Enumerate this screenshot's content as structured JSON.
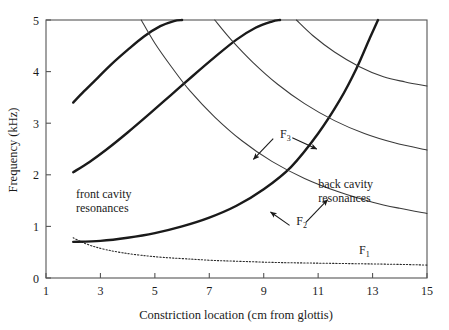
{
  "chart_data": {
    "type": "line",
    "title": "",
    "xlabel": "Constriction location (cm from glottis)",
    "ylabel": "Frequency (kHz)",
    "xlim": [
      1,
      15
    ],
    "ylim": [
      0,
      5
    ],
    "xticks": [
      "1",
      "3",
      "5",
      "7",
      "9",
      "11",
      "13",
      "15"
    ],
    "xtick_values": [
      1,
      3,
      5,
      7,
      9,
      11,
      13,
      15
    ],
    "yticks": [
      "0",
      "1",
      "2",
      "3",
      "4",
      "5"
    ],
    "ytick_values": [
      0,
      1,
      2,
      3,
      4,
      5
    ],
    "grid": false,
    "legend": "none",
    "annotations": [
      {
        "name": "front-cavity-resonances",
        "text_line1": "front cavity",
        "text_line2": "resonances",
        "x": 2.1,
        "y": 1.55
      },
      {
        "name": "back-cavity-resonances",
        "text_line1": "back cavity",
        "text_line2": "resonances",
        "x": 11.0,
        "y": 1.75
      },
      {
        "name": "label-f3",
        "text": "F",
        "sub": "3",
        "x": 9.6,
        "y": 2.72
      },
      {
        "name": "label-f2",
        "text": "F",
        "sub": "2",
        "x": 10.2,
        "y": 1.03
      },
      {
        "name": "label-f1",
        "text": "F",
        "sub": "1",
        "x": 12.5,
        "y": 0.47
      }
    ],
    "series": [
      {
        "name": "F1 (first formant)",
        "style": "dotted",
        "x": [
          2.0,
          2.3,
          2.7,
          3.2,
          3.8,
          4.5,
          5.3,
          6.2,
          7.2,
          8.3,
          9.5,
          10.7,
          12.0,
          13.3,
          14.3,
          15.0
        ],
        "y": [
          0.78,
          0.7,
          0.62,
          0.55,
          0.49,
          0.44,
          0.4,
          0.37,
          0.34,
          0.32,
          0.3,
          0.29,
          0.28,
          0.27,
          0.26,
          0.25
        ]
      },
      {
        "name": "F2 front cavity (bold, rising)",
        "style": "bold",
        "x": [
          2.0,
          3.0,
          4.0,
          5.0,
          6.0,
          7.0,
          8.0,
          9.0,
          10.0,
          11.0,
          11.8,
          12.4,
          12.9,
          13.2
        ],
        "y": [
          0.7,
          0.72,
          0.78,
          0.87,
          1.0,
          1.17,
          1.4,
          1.72,
          2.15,
          2.8,
          3.45,
          4.05,
          4.65,
          5.0
        ]
      },
      {
        "name": "F3 front cavity (bold, rising, mid)",
        "style": "bold",
        "x": [
          2.0,
          2.6,
          3.2,
          4.0,
          4.8,
          5.6,
          6.4,
          7.2,
          8.0,
          8.7,
          9.3,
          9.6
        ],
        "y": [
          2.05,
          2.25,
          2.48,
          2.82,
          3.18,
          3.55,
          3.92,
          4.28,
          4.62,
          4.85,
          4.97,
          5.0
        ]
      },
      {
        "name": "F4 front cavity (bold, rising, upper-left)",
        "style": "bold",
        "x": [
          2.0,
          2.4,
          2.9,
          3.4,
          4.0,
          4.6,
          5.2,
          5.7,
          6.0
        ],
        "y": [
          3.4,
          3.62,
          3.88,
          4.14,
          4.42,
          4.68,
          4.88,
          4.98,
          5.0
        ]
      },
      {
        "name": "back cavity resonance 1 (thin, falling)",
        "style": "thin",
        "x": [
          4.5,
          5.0,
          5.6,
          6.3,
          7.2,
          8.2,
          9.3,
          10.5,
          11.8,
          13.0,
          14.0,
          15.0
        ],
        "y": [
          5.0,
          4.55,
          4.1,
          3.62,
          3.12,
          2.66,
          2.26,
          1.93,
          1.66,
          1.47,
          1.35,
          1.25
        ]
      },
      {
        "name": "back cavity resonance 2 (thin, falling)",
        "style": "thin",
        "x": [
          7.2,
          7.8,
          8.6,
          9.5,
          10.5,
          11.6,
          12.7,
          13.8,
          15.0
        ],
        "y": [
          5.0,
          4.62,
          4.18,
          3.76,
          3.38,
          3.05,
          2.8,
          2.62,
          2.48
        ]
      },
      {
        "name": "back cavity resonance 3 (thin, falling)",
        "style": "thin",
        "x": [
          10.2,
          10.8,
          11.6,
          12.5,
          13.4,
          14.2,
          15.0
        ],
        "y": [
          5.0,
          4.7,
          4.38,
          4.1,
          3.9,
          3.8,
          3.72
        ]
      }
    ],
    "arrows": [
      {
        "name": "arrow-f3-left",
        "from_x": 9.35,
        "from_y": 2.7,
        "to_x": 8.62,
        "to_y": 2.3
      },
      {
        "name": "arrow-f3-right",
        "from_x": 10.05,
        "from_y": 2.72,
        "to_x": 10.95,
        "to_y": 2.5
      },
      {
        "name": "arrow-f2-left",
        "from_x": 9.95,
        "from_y": 1.02,
        "to_x": 9.25,
        "to_y": 1.28
      },
      {
        "name": "arrow-f2-right",
        "from_x": 10.55,
        "from_y": 1.08,
        "to_x": 11.35,
        "to_y": 1.52
      }
    ]
  }
}
